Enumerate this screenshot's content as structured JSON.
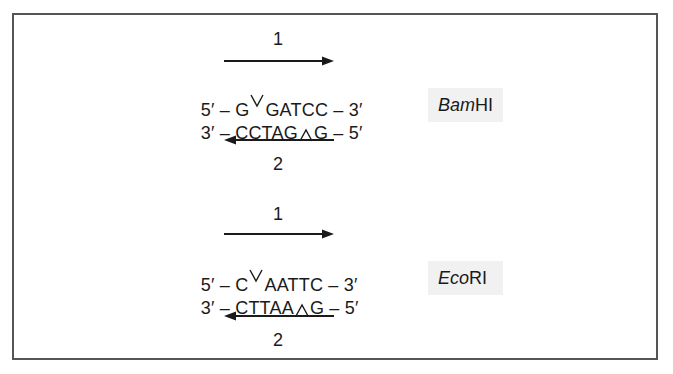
{
  "figure": {
    "border_color": "#555555",
    "label_bg": "#f1f1f1",
    "panels": [
      {
        "enzyme": {
          "italic": "Bam",
          "roman": "HI"
        },
        "top_arrow_label": "1",
        "bottom_arrow_label": "2",
        "strand_top": {
          "prefix": "5′ – G",
          "suffix": "GATCC – 3′"
        },
        "strand_bottom": {
          "prefix": "3′ – CCTAG",
          "suffix": "G – 5′"
        }
      },
      {
        "enzyme": {
          "italic": "Eco",
          "roman": "RI"
        },
        "top_arrow_label": "1",
        "bottom_arrow_label": "2",
        "strand_top": {
          "prefix": "5′ – C",
          "suffix": "AATTC – 3′"
        },
        "strand_bottom": {
          "prefix": "3′ – CTTAA",
          "suffix": "G – 5′"
        }
      }
    ]
  }
}
